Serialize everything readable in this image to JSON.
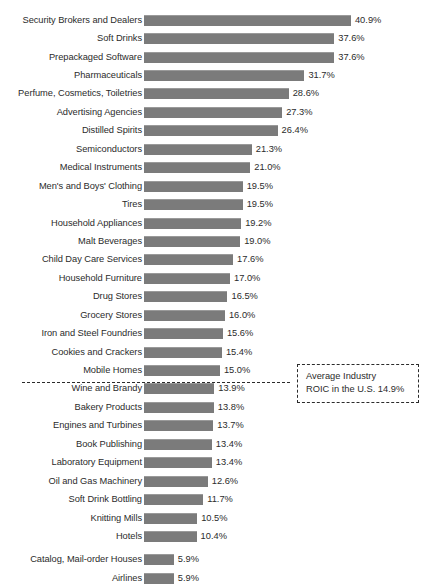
{
  "chart_data": {
    "type": "bar",
    "orientation": "horizontal",
    "title": "",
    "subtitle": "",
    "xlabel": "",
    "ylabel": "",
    "xlim": [
      0,
      40.9
    ],
    "grid": false,
    "legend": null,
    "value_suffix": "%",
    "bar_color": "#7b7b7b",
    "text_color": "#2b2b2b",
    "categories": [
      "Security Brokers and Dealers",
      "Soft Drinks",
      "Prepackaged Software",
      "Pharmaceuticals",
      "Perfume, Cosmetics, Toiletries",
      "Advertising Agencies",
      "Distilled Spirits",
      "Semiconductors",
      "Medical Instruments",
      "Men's and Boys' Clothing",
      "Tires",
      "Household Appliances",
      "Malt Beverages",
      "Child Day Care Services",
      "Household Furniture",
      "Drug Stores",
      "Grocery Stores",
      "Iron and Steel Foundries",
      "Cookies and Crackers",
      "Mobile Homes",
      "Wine and Brandy",
      "Bakery Products",
      "Engines and Turbines",
      "Book Publishing",
      "Laboratory Equipment",
      "Oil and Gas Machinery",
      "Soft Drink Bottling",
      "Knitting Mills",
      "Hotels",
      "Catalog, Mail-order Houses",
      "Airlines"
    ],
    "values": [
      40.9,
      37.6,
      37.6,
      31.7,
      28.6,
      27.3,
      26.4,
      21.3,
      21.0,
      19.5,
      19.5,
      19.2,
      19.0,
      17.6,
      17.0,
      16.5,
      16.0,
      15.6,
      15.4,
      15.0,
      13.9,
      13.8,
      13.7,
      13.4,
      13.4,
      12.6,
      11.7,
      10.5,
      10.4,
      5.9,
      5.9
    ],
    "value_labels": [
      "40.9%",
      "37.6%",
      "37.6%",
      "31.7%",
      "28.6%",
      "27.3%",
      "26.4%",
      "21.3%",
      "21.0%",
      "19.5%",
      "19.5%",
      "19.2%",
      "19.0%",
      "17.6%",
      "17.0%",
      "16.5%",
      "16.0%",
      "15.6%",
      "15.4%",
      "15.0%",
      "13.9%",
      "13.8%",
      "13.7%",
      "13.4%",
      "13.4%",
      "12.6%",
      "11.7%",
      "10.5%",
      "10.4%",
      "5.9%",
      "5.9%"
    ],
    "reference_line": {
      "value": 14.9,
      "label_line_1": "Average Industry",
      "label_line_2": "ROIC in the U.S. 14.9%",
      "after_category": "Mobile Homes",
      "style": "dashed"
    }
  }
}
